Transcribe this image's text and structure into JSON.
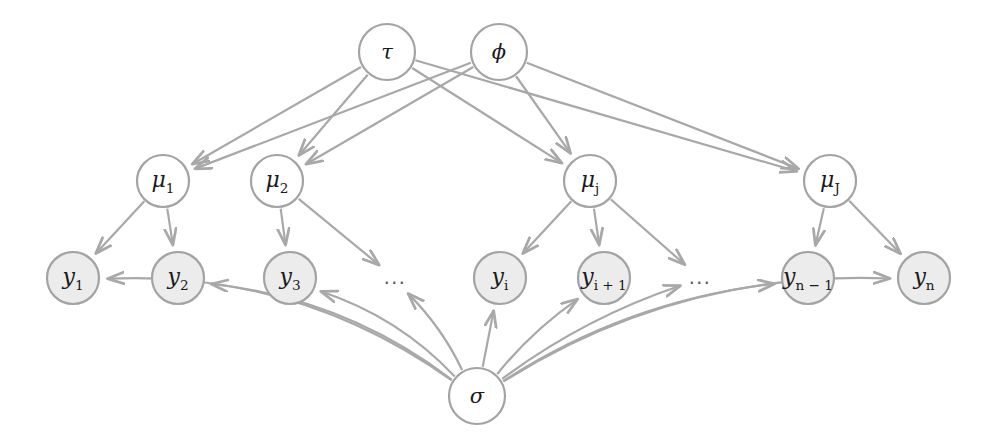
{
  "diagram": {
    "colors": {
      "edge": "#a8a8a8",
      "node_stroke": "#a3a3a3",
      "latent_fill": "#ffffff",
      "observed_fill": "#ececec",
      "label_text": "#1a1a1a",
      "background": "#ffffff"
    },
    "nodes": [
      {
        "id": "tau",
        "label": "τ",
        "sub": "",
        "cx": 387,
        "cy": 52,
        "r": 28,
        "kind": "latent"
      },
      {
        "id": "phi",
        "label": "ϕ",
        "sub": "",
        "cx": 499,
        "cy": 52,
        "r": 28,
        "kind": "latent"
      },
      {
        "id": "mu1",
        "label": "μ",
        "sub": "1",
        "cx": 163,
        "cy": 181,
        "r": 26,
        "kind": "latent"
      },
      {
        "id": "mu2",
        "label": "μ",
        "sub": "2",
        "cx": 277,
        "cy": 181,
        "r": 26,
        "kind": "latent"
      },
      {
        "id": "muj",
        "label": "μ",
        "sub": "j",
        "cx": 590,
        "cy": 181,
        "r": 26,
        "kind": "latent"
      },
      {
        "id": "muJ",
        "label": "μ",
        "sub": "J",
        "cx": 830,
        "cy": 181,
        "r": 26,
        "kind": "latent"
      },
      {
        "id": "y1",
        "label": "y",
        "sub": "1",
        "cx": 73,
        "cy": 278,
        "r": 26,
        "kind": "observed"
      },
      {
        "id": "y2",
        "label": "y",
        "sub": "2",
        "cx": 178,
        "cy": 278,
        "r": 26,
        "kind": "observed"
      },
      {
        "id": "y3",
        "label": "y",
        "sub": "3",
        "cx": 290,
        "cy": 278,
        "r": 26,
        "kind": "observed"
      },
      {
        "id": "yi",
        "label": "y",
        "sub": "i",
        "cx": 500,
        "cy": 278,
        "r": 26,
        "kind": "observed"
      },
      {
        "id": "yi1",
        "label": "y",
        "sub": "i + 1",
        "cx": 604,
        "cy": 278,
        "r": 26,
        "kind": "observed"
      },
      {
        "id": "yn1",
        "label": "y",
        "sub": "n − 1",
        "cx": 808,
        "cy": 278,
        "r": 26,
        "kind": "observed"
      },
      {
        "id": "yn",
        "label": "y",
        "sub": "n",
        "cx": 924,
        "cy": 278,
        "r": 26,
        "kind": "observed"
      },
      {
        "id": "sigma",
        "label": "σ",
        "sub": "",
        "cx": 477,
        "cy": 396,
        "r": 28,
        "kind": "latent"
      }
    ],
    "ellipses": [
      {
        "id": "ell1",
        "text": "...",
        "cx": 395,
        "cy": 278
      },
      {
        "id": "ell2",
        "text": "...",
        "cx": 700,
        "cy": 278
      }
    ],
    "edges": [
      {
        "from": "tau",
        "to": "mu1",
        "curve": 0
      },
      {
        "from": "tau",
        "to": "mu2",
        "curve": 0
      },
      {
        "from": "tau",
        "to": "muj",
        "curve": 0
      },
      {
        "from": "tau",
        "to": "muJ",
        "curve": 0
      },
      {
        "from": "phi",
        "to": "mu1",
        "curve": 0
      },
      {
        "from": "phi",
        "to": "mu2",
        "curve": 0
      },
      {
        "from": "phi",
        "to": "muj",
        "curve": 0
      },
      {
        "from": "phi",
        "to": "muJ",
        "curve": 0
      },
      {
        "from": "mu1",
        "to": "y1",
        "curve": 0
      },
      {
        "from": "mu1",
        "to": "y2",
        "curve": 0
      },
      {
        "from": "mu2",
        "to": "y3",
        "curve": 0
      },
      {
        "from": "mu2",
        "to": "ell1",
        "curve": 0
      },
      {
        "from": "muj",
        "to": "yi",
        "curve": 0
      },
      {
        "from": "muj",
        "to": "yi1",
        "curve": 0
      },
      {
        "from": "muj",
        "to": "ell2",
        "curve": 0
      },
      {
        "from": "muJ",
        "to": "yn1",
        "curve": 0
      },
      {
        "from": "muJ",
        "to": "yn",
        "curve": 0
      },
      {
        "from": "sigma",
        "to": "y1",
        "curve": 62
      },
      {
        "from": "sigma",
        "to": "y2",
        "curve": 36
      },
      {
        "from": "sigma",
        "to": "y3",
        "curve": 20
      },
      {
        "from": "sigma",
        "to": "ell1",
        "curve": 8
      },
      {
        "from": "sigma",
        "to": "yi",
        "curve": 0
      },
      {
        "from": "sigma",
        "to": "yi1",
        "curve": -8
      },
      {
        "from": "sigma",
        "to": "ell2",
        "curve": -16
      },
      {
        "from": "sigma",
        "to": "yn1",
        "curve": -34
      },
      {
        "from": "sigma",
        "to": "yn",
        "curve": -62
      }
    ]
  }
}
